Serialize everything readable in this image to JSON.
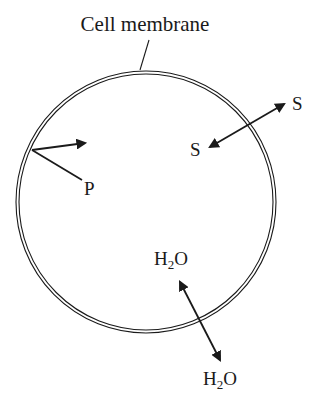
{
  "diagram": {
    "title_label": "Cell membrane",
    "labels": {
      "protein": "P",
      "solute_outside": "S",
      "solute_inside": "S",
      "water_inside_main": "H",
      "water_inside_sub": "2",
      "water_inside_tail": "O",
      "water_outside_main": "H",
      "water_outside_sub": "2",
      "water_outside_tail": "O"
    },
    "colors": {
      "stroke": "#1a1a1a",
      "background": "#ffffff"
    }
  }
}
